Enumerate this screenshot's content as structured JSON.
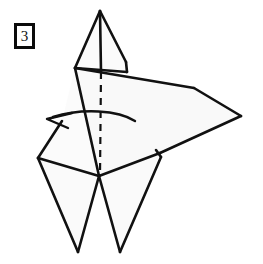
{
  "figure": {
    "kind": "origami-fold-diagram",
    "step_number": "3",
    "step_badge_label": "3",
    "canvas": {
      "width": 263,
      "height": 264
    },
    "colors": {
      "background": "#ffffff",
      "paper_fill": "#fbfbfb",
      "paper_fill_shaded": "#f7f7f7",
      "stroke": "#111111",
      "badge_border": "#0b0b0b",
      "badge_text": "#111111"
    },
    "strokes": {
      "outline_width": "2.6",
      "crease_width": "2.2",
      "dashed_width": "2.2",
      "dash_pattern": "7 6",
      "arrow_width": "2.4"
    },
    "shapes": [
      {
        "name": "upper-left-flap",
        "role": "paper-panel",
        "points": "100,11 75,68 101,72 101,11"
      },
      {
        "name": "upper-right-flap",
        "role": "paper-panel",
        "points": "100,11 126,62 127,72 101,72 101,11"
      },
      {
        "name": "right-wing",
        "role": "paper-panel",
        "points": "75,68 194,88 241,116 160,153 99,176"
      },
      {
        "name": "left-upper-panel",
        "role": "paper-panel",
        "points": "75,68 99,176 38,158 62,121"
      },
      {
        "name": "left-leg",
        "role": "paper-panel",
        "points": "38,158 99,176 78,252"
      },
      {
        "name": "right-leg",
        "role": "paper-panel",
        "points": "99,176 160,153 120,252"
      }
    ],
    "lines": [
      {
        "name": "top-center-crease",
        "kind": "solid",
        "x1": 100,
        "y1": 11,
        "x2": 101,
        "y2": 72
      },
      {
        "name": "upper-left-edge",
        "kind": "solid",
        "x1": 100,
        "y1": 11,
        "x2": 75,
        "y2": 68
      },
      {
        "name": "upper-right-edge",
        "kind": "solid",
        "x1": 100,
        "y1": 11,
        "x2": 126,
        "y2": 62
      },
      {
        "name": "upper-right-short-edge",
        "kind": "solid",
        "x1": 126,
        "y1": 62,
        "x2": 127,
        "y2": 72
      },
      {
        "name": "upper-horizontal-edge",
        "kind": "solid",
        "x1": 75,
        "y1": 68,
        "x2": 127,
        "y2": 72
      },
      {
        "name": "wing-top-edge",
        "kind": "solid",
        "x1": 75,
        "y1": 68,
        "x2": 194,
        "y2": 88
      },
      {
        "name": "wing-upper-bevel",
        "kind": "solid",
        "x1": 194,
        "y1": 88,
        "x2": 241,
        "y2": 116
      },
      {
        "name": "wing-lower-bevel",
        "kind": "solid",
        "x1": 241,
        "y1": 116,
        "x2": 160,
        "y2": 153
      },
      {
        "name": "wing-bottom-edge",
        "kind": "solid",
        "x1": 160,
        "y1": 153,
        "x2": 99,
        "y2": 176
      },
      {
        "name": "left-long-crease",
        "kind": "solid",
        "x1": 75,
        "y1": 68,
        "x2": 99,
        "y2": 176
      },
      {
        "name": "left-panel-upper-edge",
        "kind": "solid",
        "x1": 62,
        "y1": 121,
        "x2": 38,
        "y2": 158
      },
      {
        "name": "left-panel-lower-edge",
        "kind": "solid",
        "x1": 38,
        "y1": 158,
        "x2": 99,
        "y2": 176
      },
      {
        "name": "left-leg-outer-edge",
        "kind": "solid",
        "x1": 38,
        "y1": 158,
        "x2": 78,
        "y2": 252
      },
      {
        "name": "left-leg-inner-edge",
        "kind": "solid",
        "x1": 78,
        "y1": 252,
        "x2": 99,
        "y2": 176
      },
      {
        "name": "right-leg-inner-edge",
        "kind": "solid",
        "x1": 99,
        "y1": 176,
        "x2": 120,
        "y2": 252
      },
      {
        "name": "right-leg-outer-edge",
        "kind": "solid",
        "x1": 120,
        "y1": 252,
        "x2": 161,
        "y2": 157
      },
      {
        "name": "right-leg-notch",
        "kind": "solid",
        "x1": 161,
        "y1": 157,
        "x2": 156,
        "y2": 150
      },
      {
        "name": "center-fold-dashed",
        "kind": "dashed",
        "x1": 101,
        "y1": 72,
        "x2": 100,
        "y2": 176
      }
    ],
    "arrow": {
      "name": "fold-direction-arrow",
      "meaning": "fold-flap-to-the-left",
      "path": "M 135,121 C 118,110 82,108 53,117",
      "head_tip_x": 47,
      "head_tip_y": 119,
      "head_barb_a_x": 72,
      "head_barb_a_y": 113,
      "head_barb_b_x": 68,
      "head_barb_b_y": 128
    }
  }
}
